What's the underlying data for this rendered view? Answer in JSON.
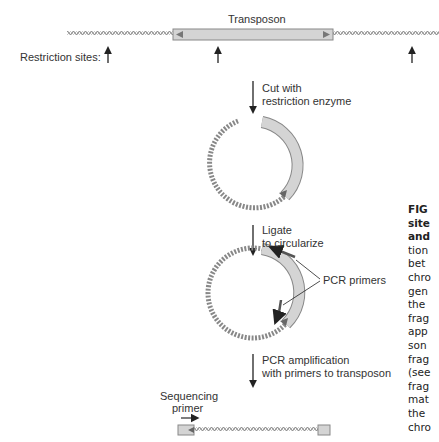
{
  "figure": {
    "transposon_label": "Transposon",
    "restriction_sites_label": "Restriction sites:",
    "steps": [
      {
        "line1": "Cut with",
        "line2": "restriction enzyme"
      },
      {
        "line1": "Ligate",
        "line2": "to circularize"
      },
      {
        "line1": "PCR amplification",
        "line2": "with primers to transposon"
      }
    ],
    "pcr_primers_label": "PCR primers",
    "sequencing_primer_line1": "Sequencing",
    "sequencing_primer_line2": "primer",
    "colors": {
      "transposon_fill": "#d4d4d4",
      "dna": "#888888",
      "primer": "#666666"
    }
  },
  "caption": {
    "lines": [
      {
        "text": "FIG",
        "bold": true
      },
      {
        "text": "site",
        "bold": true
      },
      {
        "text": "and",
        "bold": true
      },
      {
        "text": "tion",
        "bold": false
      },
      {
        "text": "bet",
        "bold": false
      },
      {
        "text": "chro",
        "bold": false
      },
      {
        "text": "gen",
        "bold": false
      },
      {
        "text": "the",
        "bold": false
      },
      {
        "text": "frag",
        "bold": false
      },
      {
        "text": "app",
        "bold": false
      },
      {
        "text": "son",
        "bold": false
      },
      {
        "text": "frag",
        "bold": false
      },
      {
        "text": "(see",
        "bold": false
      },
      {
        "text": "frag",
        "bold": false
      },
      {
        "text": "mat",
        "bold": false
      },
      {
        "text": "the",
        "bold": false
      },
      {
        "text": "chro",
        "bold": false
      }
    ]
  }
}
